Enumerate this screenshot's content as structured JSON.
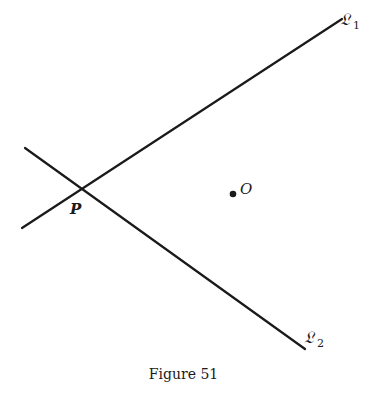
{
  "figure": {
    "caption": "Figure 51",
    "ink_color": "#1a1a1a",
    "lines": [
      {
        "id": "L1",
        "label": "𝔏",
        "subscript": "1",
        "x1": 22,
        "y1": 228,
        "x2": 342,
        "y2": 19
      },
      {
        "id": "L2",
        "label": "𝔏",
        "subscript": "2",
        "x1": 25,
        "y1": 148,
        "x2": 305,
        "y2": 349
      }
    ],
    "points": [
      {
        "id": "P",
        "label": "P",
        "x": 82,
        "y": 189,
        "marked": false
      },
      {
        "id": "O",
        "label": "O",
        "x": 233,
        "y": 194,
        "marked": true
      }
    ]
  }
}
